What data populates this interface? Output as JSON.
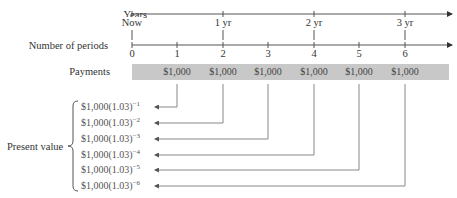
{
  "diagram": {
    "row_labels": {
      "years": "Years",
      "periods": "Number of periods",
      "payments": "Payments",
      "present_value": "Present value"
    },
    "year_ticks": [
      "Now",
      "1 yr",
      "2 yr",
      "3 yr"
    ],
    "period_ticks": [
      "0",
      "1",
      "2",
      "3",
      "4",
      "5",
      "6"
    ],
    "payments": [
      "$1,000",
      "$1,000",
      "$1,000",
      "$1,000",
      "$1,000",
      "$1,000"
    ],
    "present_values": [
      {
        "base": "$1,000(1.03)",
        "exp": "−1"
      },
      {
        "base": "$1,000(1.03)",
        "exp": "−2"
      },
      {
        "base": "$1,000(1.03)",
        "exp": "−3"
      },
      {
        "base": "$1,000(1.03)",
        "exp": "−4"
      },
      {
        "base": "$1,000(1.03)",
        "exp": "−5"
      },
      {
        "base": "$1,000(1.03)",
        "exp": "−6"
      }
    ],
    "colors": {
      "line": "#555555",
      "bar": "#c8c8c8",
      "connector": "#888888"
    }
  }
}
